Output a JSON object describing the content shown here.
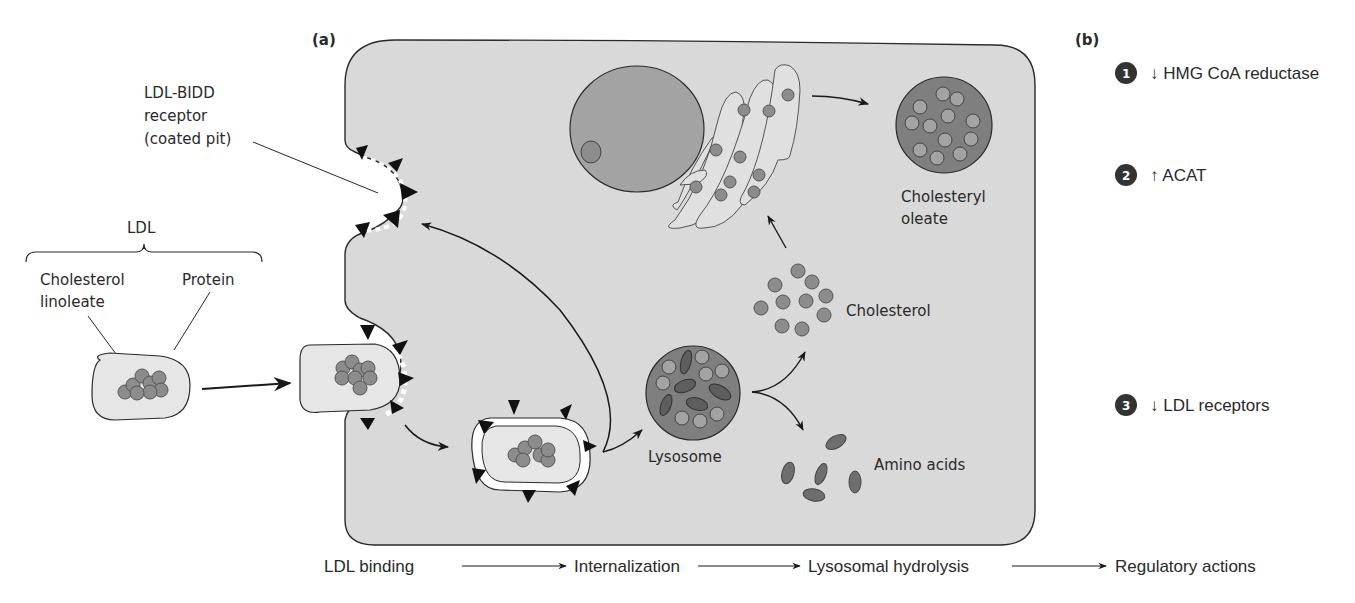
{
  "panel_a": {
    "label": "(a)",
    "receptor_label": [
      "LDL-BIDD",
      "receptor",
      "(coated pit)"
    ],
    "ldl_label": "LDL",
    "ldl_parts": {
      "cholesterol": [
        "Cholesterol",
        "linoleate"
      ],
      "protein": "Protein"
    },
    "lysosome_label": "Lysosome",
    "cholesterol_label": "Cholesterol",
    "amino_acids_label": "Amino acids",
    "cholesteryl_oleate_label": [
      "Cholesteryl",
      "oleate"
    ]
  },
  "panel_b": {
    "label": "(b)",
    "actions": [
      {
        "number": "1",
        "arrow": "↓",
        "text": "HMG CoA reductase"
      },
      {
        "number": "2",
        "arrow": "↑",
        "text": "ACAT"
      },
      {
        "number": "3",
        "arrow": "↓",
        "text": "LDL receptors"
      }
    ]
  },
  "process_steps": [
    "LDL binding",
    "Internalization",
    "Lysosomal hydrolysis",
    "Regulatory actions"
  ],
  "colors": {
    "cell_fill": "#d9d9d9",
    "organelle_fill": "#a3a3a3",
    "dark_organelle": "#7f7f7f",
    "particle": "#8c8c8c",
    "vesicle_fill": "#e6e6e6",
    "outline": "#2a2a2a",
    "badge": "#333333"
  }
}
